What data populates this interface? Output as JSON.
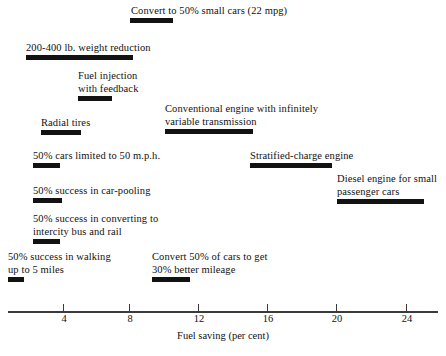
{
  "chart_data": {
    "type": "bar",
    "title": "",
    "xlabel": "Fuel saving (per cent)",
    "ylabel": "",
    "xlim": [
      0,
      26
    ],
    "xticks": [
      4,
      8,
      12,
      16,
      20,
      24
    ],
    "xtick_labels": [
      "4",
      "8",
      "12",
      "16",
      "20",
      "24"
    ],
    "grid": false,
    "legend": "none",
    "orientation": "horizontal",
    "note": "Floating horizontal range bars; each bar spans a fuel-saving percentage interval.",
    "categories": [
      "Convert to 50% small cars (22 mpg)",
      "200-400 lb. weight reduction",
      "Fuel injection with feedback",
      "Conventional engine with infinitely variable transmission",
      "Radial tires",
      "50% cars limited to 50 m.p.h.",
      "Stratified-charge engine",
      "Diesel engine for small passenger cars",
      "50% success in car-pooling",
      "50% success in converting to intercity bus and rail",
      "50% success in walking up to 5 miles",
      "Convert 50% of cars to get 30% better mileage"
    ],
    "bars": [
      {
        "label_lines": [
          "Convert to 50% small cars (22 mpg)"
        ],
        "x_start": 7.9,
        "x_end": 10.4
      },
      {
        "label_lines": [
          "200-400 lb. weight reduction"
        ],
        "x_start": 1.8,
        "x_end": 8.1
      },
      {
        "label_lines": [
          "Fuel injection",
          "with feedback"
        ],
        "x_start": 4.9,
        "x_end": 6.9
      },
      {
        "label_lines": [
          "Conventional engine with infinitely",
          "variable transmission"
        ],
        "x_start": 10.0,
        "x_end": 15.1
      },
      {
        "label_lines": [
          "Radial tires"
        ],
        "x_start": 2.7,
        "x_end": 5.1
      },
      {
        "label_lines": [
          "50% cars limited to 50 m.p.h."
        ],
        "x_start": 2.3,
        "x_end": 3.9
      },
      {
        "label_lines": [
          "Stratified-charge engine"
        ],
        "x_start": 14.9,
        "x_end": 19.7
      },
      {
        "label_lines": [
          "Diesel engine for small",
          "passenger cars"
        ],
        "x_start": 20.0,
        "x_end": 25.1
      },
      {
        "label_lines": [
          "50% success in car-pooling"
        ],
        "x_start": 2.3,
        "x_end": 4.0
      },
      {
        "label_lines": [
          "50% success in converting to",
          "intercity bus and rail"
        ],
        "x_start": 2.3,
        "x_end": 3.9
      },
      {
        "label_lines": [
          "50% success in walking",
          "up to 5 miles"
        ],
        "x_start": 0.8,
        "x_end": 1.7
      },
      {
        "label_lines": [
          "Convert 50% of cars to get",
          "30% better mileage"
        ],
        "x_start": 9.2,
        "x_end": 11.4
      }
    ]
  },
  "layout": {
    "items": [
      {
        "name": "convert-small-cars",
        "label_x": 131,
        "label_y": 4,
        "bar_x": 130,
        "bar_y": 18,
        "bar_w": 43
      },
      {
        "name": "weight-reduction",
        "label_x": 26,
        "label_y": 41,
        "bar_x": 26,
        "bar_y": 55,
        "bar_w": 107
      },
      {
        "name": "fuel-injection",
        "label_x": 78,
        "label_y": 69,
        "bar_x": 78,
        "bar_y": 96,
        "bar_w": 34
      },
      {
        "name": "cvt-engine",
        "label_x": 165,
        "label_y": 102,
        "bar_x": 165,
        "bar_y": 129,
        "bar_w": 88
      },
      {
        "name": "radial-tires",
        "label_x": 41,
        "label_y": 116,
        "bar_x": 41,
        "bar_y": 130,
        "bar_w": 40
      },
      {
        "name": "cars-limited-50mph",
        "label_x": 33,
        "label_y": 149,
        "bar_x": 33,
        "bar_y": 163,
        "bar_w": 27
      },
      {
        "name": "stratified-charge",
        "label_x": 250,
        "label_y": 149,
        "bar_x": 250,
        "bar_y": 163,
        "bar_w": 82
      },
      {
        "name": "diesel-engine",
        "label_x": 337,
        "label_y": 172,
        "bar_x": 337,
        "bar_y": 199,
        "bar_w": 87
      },
      {
        "name": "car-pooling",
        "label_x": 33,
        "label_y": 184,
        "bar_x": 33,
        "bar_y": 198,
        "bar_w": 29
      },
      {
        "name": "intercity-bus-rail",
        "label_x": 33,
        "label_y": 212,
        "bar_x": 33,
        "bar_y": 239,
        "bar_w": 27
      },
      {
        "name": "walking-5-miles",
        "label_x": 8,
        "label_y": 250,
        "bar_x": 8,
        "bar_y": 277,
        "bar_w": 16
      },
      {
        "name": "convert-30-better-mpg",
        "label_x": 152,
        "label_y": 250,
        "bar_x": 152,
        "bar_y": 277,
        "bar_w": 38
      }
    ],
    "axis": {
      "line_x": 8,
      "line_y": 311,
      "line_w": 430,
      "tick_positions_px": [
        63,
        129,
        198,
        267,
        336,
        406
      ],
      "tick_top": 304,
      "tick_height": 8,
      "tick_label_y": 313,
      "title_y": 330
    }
  }
}
